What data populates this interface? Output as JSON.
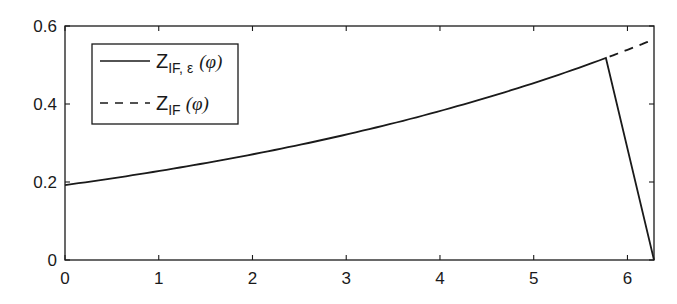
{
  "chart_data": {
    "type": "line",
    "title": "",
    "xlabel": "",
    "ylabel": "",
    "xlim": [
      0,
      6.2832
    ],
    "ylim": [
      0,
      0.6
    ],
    "grid": false,
    "legend_position": "upper-left",
    "x_ticks": [
      0,
      1,
      2,
      3,
      4,
      5,
      6
    ],
    "x_tick_labels": [
      "0",
      "1",
      "2",
      "3",
      "4",
      "5",
      "6"
    ],
    "y_ticks": [
      0,
      0.2,
      0.4,
      0.6
    ],
    "y_tick_labels": [
      "0",
      "0.2",
      "0.4",
      "0.6"
    ],
    "series": [
      {
        "name": "Z_IF,ε(φ)",
        "legend_main": "Z",
        "legend_sub": "IF, ε",
        "legend_arg": "(φ)",
        "style": "solid",
        "x": [
          0,
          0.5,
          1,
          1.5,
          2,
          2.5,
          3,
          3.5,
          4,
          4.5,
          5,
          5.5,
          5.77,
          6.2832
        ],
        "y": [
          0.192,
          0.209,
          0.228,
          0.248,
          0.27,
          0.295,
          0.321,
          0.35,
          0.381,
          0.415,
          0.452,
          0.493,
          0.518,
          0.0
        ]
      },
      {
        "name": "Z_IF(φ)",
        "legend_main": "Z",
        "legend_sub": "IF",
        "legend_arg": "(φ)",
        "style": "dashed",
        "x": [
          5.77,
          6.0,
          6.2832
        ],
        "y": [
          0.518,
          0.539,
          0.566
        ]
      }
    ]
  }
}
